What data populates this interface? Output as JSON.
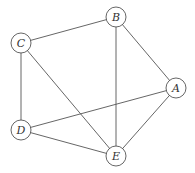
{
  "diagram": {
    "type": "undirected-graph",
    "node_radius": 10,
    "stroke_color": "#555555",
    "nodes": [
      {
        "id": "A",
        "label": "A",
        "x": 176,
        "y": 88
      },
      {
        "id": "B",
        "label": "B",
        "x": 116,
        "y": 17
      },
      {
        "id": "C",
        "label": "C",
        "x": 21,
        "y": 43
      },
      {
        "id": "D",
        "label": "D",
        "x": 21,
        "y": 130
      },
      {
        "id": "E",
        "label": "E",
        "x": 116,
        "y": 156
      }
    ],
    "edges": [
      {
        "from": "C",
        "to": "B"
      },
      {
        "from": "B",
        "to": "E"
      },
      {
        "from": "B",
        "to": "A"
      },
      {
        "from": "C",
        "to": "D"
      },
      {
        "from": "C",
        "to": "E"
      },
      {
        "from": "D",
        "to": "A"
      },
      {
        "from": "D",
        "to": "E"
      },
      {
        "from": "A",
        "to": "E"
      }
    ]
  }
}
